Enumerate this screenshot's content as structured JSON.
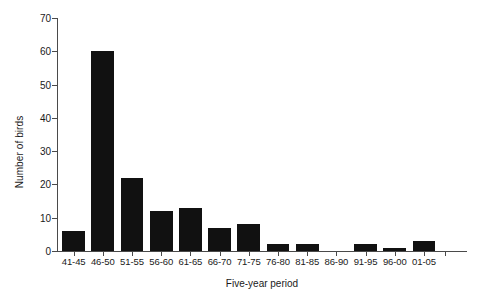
{
  "chart_data": {
    "type": "bar",
    "title": "",
    "xlabel": "Five-year period",
    "ylabel": "Number of birds",
    "categories": [
      "41-45",
      "46-50",
      "51-55",
      "56-60",
      "61-65",
      "66-70",
      "71-75",
      "76-80",
      "81-85",
      "86-90",
      "91-95",
      "96-00",
      "01-05"
    ],
    "values": [
      6,
      60,
      22,
      12,
      13,
      7,
      8,
      2,
      2,
      0,
      2,
      1,
      3
    ],
    "ylim": [
      0,
      70
    ],
    "yticks": [
      0,
      10,
      20,
      30,
      40,
      50,
      60,
      70
    ],
    "ytick_labels": [
      "0",
      "10",
      "20",
      "30",
      "40",
      "50",
      "60",
      "70"
    ],
    "grid": false,
    "legend": false,
    "bar_color": "#111111",
    "axis_color": "#4a4a4a"
  }
}
